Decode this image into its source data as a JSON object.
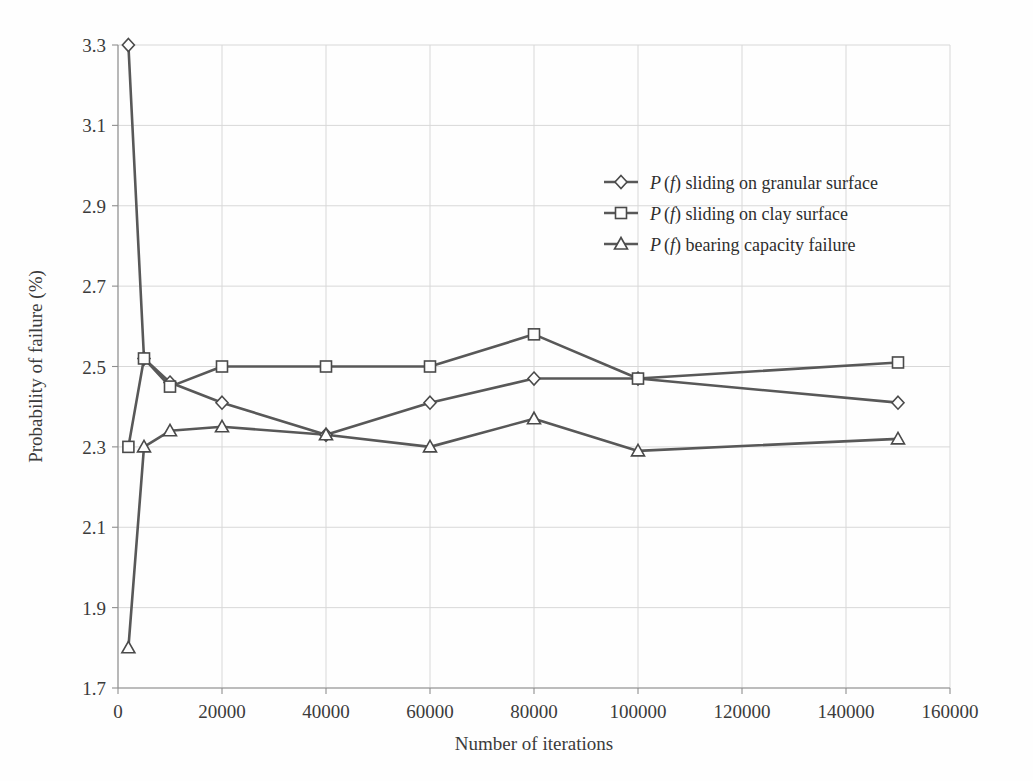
{
  "chart_data": {
    "type": "line",
    "title": "",
    "xlabel": "Number of iterations",
    "ylabel": "Probability of failure (%)",
    "xlim": [
      0,
      160000
    ],
    "ylim": [
      1.7,
      3.3
    ],
    "xticks": [
      0,
      20000,
      40000,
      60000,
      80000,
      100000,
      120000,
      140000,
      160000
    ],
    "xtick_labels": [
      "0",
      "20000",
      "40000",
      "60000",
      "80000",
      "100000",
      "120000",
      "140000",
      "160000"
    ],
    "yticks": [
      1.7,
      1.9,
      2.1,
      2.3,
      2.5,
      2.7,
      2.9,
      3.1,
      3.3
    ],
    "ytick_labels": [
      "1.7",
      "1.9",
      "2.1",
      "2.3",
      "2.5",
      "2.7",
      "2.9",
      "3.1",
      "3.3"
    ],
    "grid": true,
    "legend_position": "upper right",
    "x": [
      2000,
      5000,
      10000,
      20000,
      40000,
      60000,
      80000,
      100000,
      150000
    ],
    "series": [
      {
        "name": "P (f) sliding on granular surface",
        "marker": "diamond",
        "color": "#585858",
        "values": [
          3.3,
          2.52,
          2.46,
          2.41,
          2.33,
          2.41,
          2.47,
          2.47,
          2.41
        ]
      },
      {
        "name": "P (f) sliding on clay surface",
        "marker": "square",
        "color": "#585858",
        "values": [
          2.3,
          2.52,
          2.45,
          2.5,
          2.5,
          2.5,
          2.58,
          2.47,
          2.51
        ]
      },
      {
        "name": "P (f) bearing capacity failure",
        "marker": "triangle",
        "color": "#585858",
        "values": [
          1.8,
          2.3,
          2.34,
          2.35,
          2.33,
          2.3,
          2.37,
          2.29,
          2.32
        ]
      }
    ]
  },
  "legend": {
    "entries": [
      {
        "prefix": "P",
        "arg": "(f)",
        "text": " sliding on granular surface",
        "marker": "diamond"
      },
      {
        "prefix": "P",
        "arg": "(f)",
        "text": " sliding on clay surface",
        "marker": "square"
      },
      {
        "prefix": "P",
        "arg": "(f)",
        "text": " bearing capacity failure",
        "marker": "triangle"
      }
    ]
  },
  "axes": {
    "x_title": "Number of iterations",
    "y_title": "Probability of failure (%)"
  }
}
